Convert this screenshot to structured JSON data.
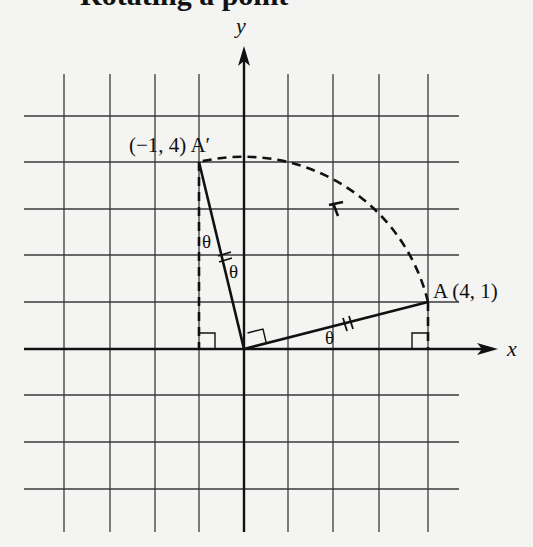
{
  "heading": {
    "partial_text": "Rotating a point",
    "visible": "cropped-descenders-only"
  },
  "axes": {
    "x_label": "x",
    "y_label": "y"
  },
  "grid": {
    "x_min": -4,
    "x_max": 4,
    "y_min": -3,
    "y_max": 5,
    "vertical_lines_x_units": [
      -4,
      -3,
      -2,
      -1,
      1,
      2,
      3,
      4
    ],
    "horizontal_lines_y_units": [
      5,
      4,
      3,
      2,
      1,
      -1,
      -2,
      -3
    ]
  },
  "points": {
    "A": {
      "name": "A",
      "coords_label": "(4, 1)",
      "x": 4,
      "y": 1,
      "label": "A (4, 1)"
    },
    "A_prime": {
      "name": "A′",
      "coords_label": "(−1, 4)",
      "x": -1,
      "y": 4,
      "label": "(−1, 4) A′"
    }
  },
  "angles": {
    "theta_symbol": "θ",
    "theta_count": 3
  },
  "annotations": {
    "right_angle_markers": [
      "at origin between OA and OA′",
      "at (−1, 0)",
      "at (4, 0)"
    ],
    "congruence_ticks": [
      "double hash on OA",
      "double hash on OA′"
    ],
    "rotation_arc": "dashed arc from A to A′ with arrowhead (counterclockwise 90°)"
  },
  "labels": {
    "y": "y",
    "x": "x",
    "a_prime": "(−1, 4) A′",
    "a": "A (4, 1)",
    "theta1": "θ",
    "theta2": "θ",
    "theta3": "θ"
  }
}
